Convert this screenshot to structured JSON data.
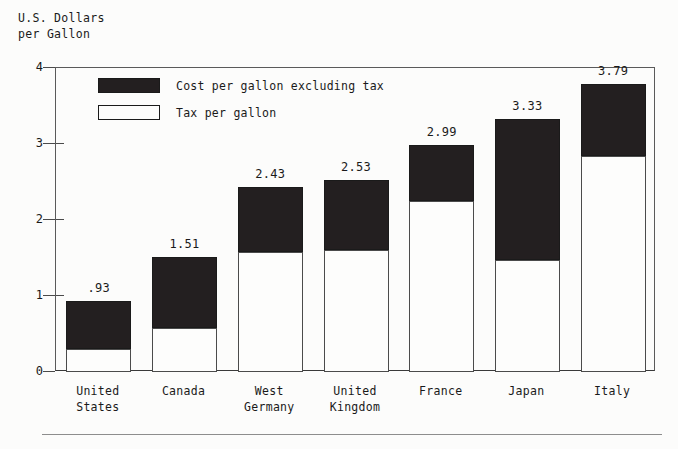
{
  "axis_title": {
    "line1": "U.S. Dollars",
    "line2": "per Gallon"
  },
  "legend": {
    "items": [
      {
        "label": "Cost per gallon excluding tax",
        "swatch": "dark-square-icon",
        "color": "#231f20"
      },
      {
        "label": "Tax per gallon",
        "swatch": "light-square-icon",
        "color": "#ffffff"
      }
    ]
  },
  "chart_data": {
    "type": "bar",
    "subtype": "stacked-vertical",
    "title": "",
    "subtitle": "",
    "xlabel": "",
    "ylabel": "U.S. Dollars per Gallon",
    "ylim": [
      0,
      4
    ],
    "yticks": [
      0,
      1,
      2,
      3,
      4
    ],
    "ytick_labels": [
      "0",
      "1",
      "2",
      "3",
      "4"
    ],
    "grid": false,
    "legend_position": "inside-top-left",
    "categories": [
      "United\nStates",
      "Canada",
      "West\nGermany",
      "United\nKingdom",
      "France",
      "Japan",
      "Italy"
    ],
    "category_names": [
      "United States",
      "Canada",
      "West Germany",
      "United Kingdom",
      "France",
      "Japan",
      "Italy"
    ],
    "series": [
      {
        "name": "Tax per gallon",
        "color": "#ffffff",
        "values": [
          0.3,
          0.58,
          1.58,
          1.61,
          2.25,
          1.48,
          2.84
        ]
      },
      {
        "name": "Cost per gallon excluding tax",
        "color": "#231f20",
        "values": [
          0.63,
          0.93,
          0.85,
          0.92,
          0.74,
          1.85,
          0.95
        ]
      }
    ],
    "totals": [
      0.93,
      1.51,
      2.43,
      2.53,
      2.99,
      3.33,
      3.79
    ],
    "total_labels": [
      ".93",
      "1.51",
      "2.43",
      "2.53",
      "2.99",
      "3.33",
      "3.79"
    ]
  }
}
